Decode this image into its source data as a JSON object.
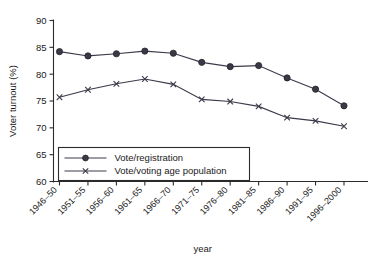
{
  "chart_data": {
    "type": "line",
    "title": "",
    "xlabel": "year",
    "ylabel": "Voter turnout (%)",
    "categories": [
      "1946–50",
      "1951–55",
      "1956–60",
      "1961–65",
      "1966–70",
      "1971–75",
      "1976–80",
      "1981–85",
      "1986–90",
      "1991–95",
      "1996–2000"
    ],
    "ylim": [
      60,
      90
    ],
    "yticks": [
      60,
      65,
      70,
      75,
      80,
      85,
      90
    ],
    "ytick_labels": [
      "60",
      "65",
      "70",
      "75",
      "80",
      "85",
      "90"
    ],
    "grid": false,
    "legend_position": "lower-left-inside",
    "series": [
      {
        "name": "Vote/registration",
        "marker": "circle",
        "values": [
          84.2,
          83.4,
          83.8,
          84.3,
          83.9,
          82.2,
          81.4,
          81.6,
          79.3,
          77.2,
          74.1
        ]
      },
      {
        "name": "Vote/voting age population",
        "marker": "cross",
        "values": [
          75.7,
          77.1,
          78.2,
          79.1,
          78.1,
          75.3,
          74.9,
          74.0,
          71.9,
          71.3,
          70.3
        ]
      }
    ]
  },
  "legend": {
    "entries": [
      {
        "label": "Vote/registration"
      },
      {
        "label": "Vote/voting age population"
      }
    ]
  },
  "colors": {
    "series": "#3a3a46",
    "axis": "#2b2b2b",
    "background": "#ffffff"
  }
}
